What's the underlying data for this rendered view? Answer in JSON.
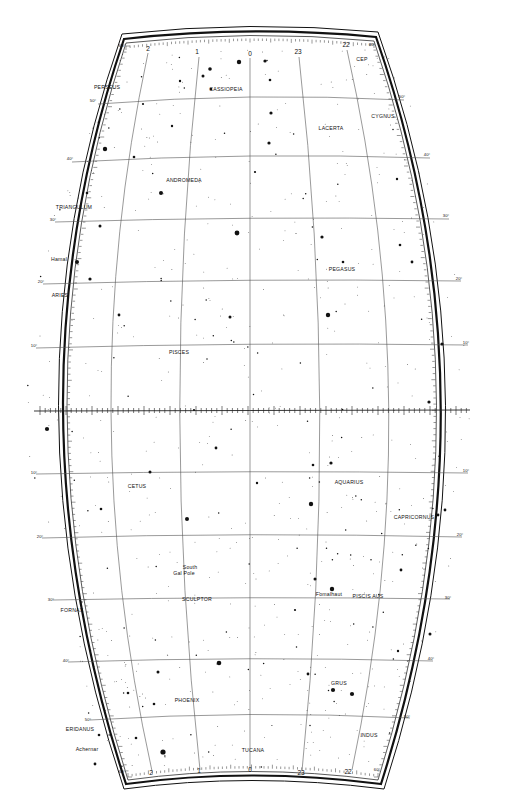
{
  "map": {
    "title": "Star chart — Andromeda / Pisces / Aquarius region",
    "ra_range_hours": [
      22,
      2
    ],
    "dec_range_deg": [
      -60,
      60
    ],
    "colors": {
      "background": "#ffffff",
      "ink": "#111111",
      "grid": "#555555"
    },
    "ra_labels_top": [
      {
        "text": "2",
        "x": 148,
        "y": 51
      },
      {
        "text": "1",
        "x": 197,
        "y": 54
      },
      {
        "text": "0",
        "x": 250,
        "y": 56
      },
      {
        "text": "23",
        "x": 298,
        "y": 54
      },
      {
        "text": "22",
        "x": 346,
        "y": 47
      }
    ],
    "ra_labels_bottom": [
      {
        "text": "2",
        "x": 151,
        "y": 775
      },
      {
        "text": "1",
        "x": 199,
        "y": 773
      },
      {
        "text": "0",
        "x": 250,
        "y": 772
      },
      {
        "text": "23",
        "x": 301,
        "y": 775
      },
      {
        "text": "22",
        "x": 348,
        "y": 774
      }
    ],
    "dec_labels_left": [
      {
        "text": "60°",
        "x": 122,
        "y": 47
      },
      {
        "text": "50°",
        "x": 93,
        "y": 102
      },
      {
        "text": "40°",
        "x": 70,
        "y": 160
      },
      {
        "text": "30°",
        "x": 53,
        "y": 221
      },
      {
        "text": "20°",
        "x": 41,
        "y": 283
      },
      {
        "text": "10°",
        "x": 34,
        "y": 347
      },
      {
        "text": "10°",
        "x": 34,
        "y": 474
      },
      {
        "text": "20°",
        "x": 40,
        "y": 538
      },
      {
        "text": "30°",
        "x": 51,
        "y": 601
      },
      {
        "text": "40°",
        "x": 66,
        "y": 662
      },
      {
        "text": "50°",
        "x": 88,
        "y": 721
      },
      {
        "text": "60°",
        "x": 122,
        "y": 773
      }
    ],
    "dec_labels_right": [
      {
        "text": "60°",
        "x": 372,
        "y": 46
      },
      {
        "text": "50°",
        "x": 402,
        "y": 98
      },
      {
        "text": "40°",
        "x": 427,
        "y": 156
      },
      {
        "text": "30°",
        "x": 446,
        "y": 217
      },
      {
        "text": "20°",
        "x": 459,
        "y": 280
      },
      {
        "text": "10°",
        "x": 466,
        "y": 344
      },
      {
        "text": "10°",
        "x": 466,
        "y": 472
      },
      {
        "text": "20°",
        "x": 460,
        "y": 536
      },
      {
        "text": "30°",
        "x": 448,
        "y": 599
      },
      {
        "text": "40°",
        "x": 431,
        "y": 660
      },
      {
        "text": "50°",
        "x": 407,
        "y": 718
      },
      {
        "text": "60°",
        "x": 377,
        "y": 771
      }
    ],
    "constellations": [
      {
        "name": "PERSEUS",
        "x": 107,
        "y": 89
      },
      {
        "name": "CASSIOPEIA",
        "x": 226,
        "y": 91
      },
      {
        "name": "CEP",
        "x": 362,
        "y": 61
      },
      {
        "name": "CYGNUS",
        "x": 383,
        "y": 118
      },
      {
        "name": "LACERTA",
        "x": 331,
        "y": 130
      },
      {
        "name": "ANDROMEDA",
        "x": 184,
        "y": 182
      },
      {
        "name": "TRIANGULUM",
        "x": 74,
        "y": 209
      },
      {
        "name": "PEGASUS",
        "x": 342,
        "y": 271
      },
      {
        "name": "ARIES",
        "x": 60,
        "y": 297
      },
      {
        "name": "PISCES",
        "x": 179,
        "y": 354
      },
      {
        "name": "CETUS",
        "x": 137,
        "y": 488
      },
      {
        "name": "AQUARIUS",
        "x": 349,
        "y": 484
      },
      {
        "name": "CAPRICORNUS",
        "x": 414,
        "y": 519
      },
      {
        "name": "SCULPTOR",
        "x": 197,
        "y": 601
      },
      {
        "name": "PISCIS AUS",
        "x": 368,
        "y": 598
      },
      {
        "name": "FORNAX",
        "x": 72,
        "y": 612
      },
      {
        "name": "GRUS",
        "x": 339,
        "y": 685
      },
      {
        "name": "PHOENIX",
        "x": 187,
        "y": 702
      },
      {
        "name": "ERIDANUS",
        "x": 80,
        "y": 731
      },
      {
        "name": "INDUS",
        "x": 369,
        "y": 737
      },
      {
        "name": "TUCANA",
        "x": 253,
        "y": 752
      }
    ],
    "named_stars": [
      {
        "name": "Hamal",
        "x": 59,
        "y": 261
      },
      {
        "name": "Fomalhaut",
        "x": 329,
        "y": 596
      },
      {
        "name": "Achernar",
        "x": 87,
        "y": 751
      }
    ],
    "annotations": [
      {
        "text": "South",
        "x": 190,
        "y": 569
      },
      {
        "text": "Gal Pole",
        "x": 184,
        "y": 575
      }
    ]
  }
}
